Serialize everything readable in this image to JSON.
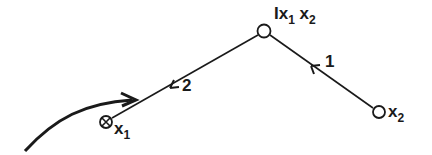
{
  "diagram": {
    "nodes": [
      {
        "id": "top",
        "label_prefix": "I",
        "label_main": "x",
        "label_sub1": "1",
        "label_mid": " x",
        "label_sub2": "2"
      },
      {
        "id": "x2",
        "label_main": "x",
        "label_sub": "2"
      },
      {
        "id": "x1",
        "label_main": "x",
        "label_sub": "1"
      }
    ],
    "edges": [
      {
        "from": "x2",
        "to": "top",
        "label": "1"
      },
      {
        "from": "top",
        "to": "x1",
        "label": "2"
      }
    ],
    "colors": {
      "stroke": "#1a1a1a",
      "background": "#ffffff"
    }
  }
}
